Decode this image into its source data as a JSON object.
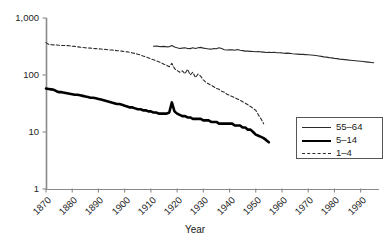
{
  "chart_data": {
    "type": "line",
    "title": "",
    "xlabel": "Year",
    "ylabel": "",
    "yscale": "log",
    "ylim": [
      1,
      1000
    ],
    "xlim": [
      1870,
      1997
    ],
    "grid": false,
    "legend_position": "bottom-right",
    "ytick_labels": [
      "1,000",
      "100",
      "10",
      "1"
    ],
    "ytick_values": [
      1000,
      100,
      10,
      1
    ],
    "xtick_labels": [
      "1870",
      "1880",
      "1890",
      "1900",
      "1910",
      "1920",
      "1930",
      "1940",
      "1950",
      "1960",
      "1970",
      "1980",
      "1990"
    ],
    "xtick_values": [
      1870,
      1880,
      1890,
      1900,
      1910,
      1920,
      1930,
      1940,
      1950,
      1960,
      1970,
      1980,
      1990
    ],
    "series": [
      {
        "name": "55–64",
        "style": "thin-solid",
        "color": "#2b2b2b",
        "x": [
          1911,
          1912,
          1913,
          1914,
          1915,
          1916,
          1917,
          1918,
          1919,
          1920,
          1921,
          1922,
          1923,
          1924,
          1925,
          1926,
          1927,
          1928,
          1929,
          1930,
          1931,
          1932,
          1933,
          1934,
          1935,
          1936,
          1937,
          1938,
          1939,
          1940,
          1941,
          1942,
          1943,
          1944,
          1945,
          1946,
          1947,
          1948,
          1949,
          1950,
          1951,
          1952,
          1953,
          1954,
          1955,
          1956,
          1957,
          1958,
          1959,
          1960,
          1961,
          1962,
          1963,
          1964,
          1965,
          1966,
          1967,
          1968,
          1969,
          1970,
          1971,
          1972,
          1973,
          1974,
          1975,
          1976,
          1977,
          1978,
          1979,
          1980,
          1981,
          1982,
          1983,
          1984,
          1985,
          1986,
          1987,
          1988,
          1989,
          1990,
          1991,
          1992,
          1993,
          1994,
          1995
        ],
        "y": [
          320,
          322,
          318,
          315,
          318,
          312,
          314,
          330,
          310,
          300,
          292,
          296,
          300,
          292,
          290,
          300,
          292,
          300,
          305,
          296,
          292,
          286,
          284,
          292,
          288,
          300,
          292,
          278,
          274,
          276,
          278,
          272,
          280,
          272,
          268,
          262,
          262,
          260,
          258,
          256,
          258,
          254,
          252,
          248,
          250,
          248,
          250,
          246,
          246,
          244,
          240,
          242,
          240,
          236,
          234,
          232,
          230,
          230,
          228,
          226,
          224,
          222,
          220,
          216,
          212,
          208,
          206,
          202,
          200,
          196,
          194,
          190,
          188,
          186,
          184,
          182,
          180,
          178,
          176,
          174,
          172,
          170,
          168,
          166,
          164
        ]
      },
      {
        "name": "5–14",
        "style": "thick-solid",
        "color": "#000000",
        "x": [
          1870,
          1871,
          1872,
          1873,
          1874,
          1875,
          1876,
          1877,
          1878,
          1879,
          1880,
          1881,
          1882,
          1883,
          1884,
          1885,
          1886,
          1887,
          1888,
          1889,
          1890,
          1891,
          1892,
          1893,
          1894,
          1895,
          1896,
          1897,
          1898,
          1899,
          1900,
          1901,
          1902,
          1903,
          1904,
          1905,
          1906,
          1907,
          1908,
          1909,
          1910,
          1911,
          1912,
          1913,
          1914,
          1915,
          1916,
          1917,
          1918,
          1919,
          1920,
          1921,
          1922,
          1923,
          1924,
          1925,
          1926,
          1927,
          1928,
          1929,
          1930,
          1931,
          1932,
          1933,
          1934,
          1935,
          1936,
          1937,
          1938,
          1939,
          1940,
          1941,
          1942,
          1943,
          1944,
          1945,
          1946,
          1947,
          1948,
          1949,
          1950,
          1951,
          1952,
          1953,
          1954,
          1955
        ],
        "y": [
          58,
          57,
          56,
          55,
          52,
          50,
          50,
          49,
          48,
          47,
          46,
          45,
          45,
          44,
          43,
          42,
          41,
          40,
          40,
          39,
          38,
          37,
          36,
          35,
          34,
          33,
          32,
          31,
          31,
          30,
          29,
          28,
          27,
          27,
          26,
          25,
          25,
          24,
          24,
          23,
          23,
          22,
          22,
          21,
          21,
          21,
          21,
          22,
          33,
          23,
          21,
          20,
          19,
          19,
          18,
          18,
          17,
          17,
          17,
          17,
          16,
          16,
          16,
          15,
          15,
          15,
          14,
          14,
          14,
          14,
          14,
          14,
          13,
          13,
          13,
          12,
          12,
          11,
          11,
          10,
          9,
          8.6,
          8.2,
          7.8,
          7.2,
          6.6
        ]
      },
      {
        "name": "1–4",
        "style": "dashed",
        "color": "#2b2b2b",
        "x": [
          1870,
          1871,
          1872,
          1873,
          1874,
          1875,
          1876,
          1877,
          1878,
          1879,
          1880,
          1881,
          1882,
          1883,
          1884,
          1885,
          1886,
          1887,
          1888,
          1889,
          1890,
          1891,
          1892,
          1893,
          1894,
          1895,
          1896,
          1897,
          1898,
          1899,
          1900,
          1901,
          1902,
          1903,
          1904,
          1905,
          1906,
          1907,
          1908,
          1909,
          1910,
          1911,
          1912,
          1913,
          1914,
          1915,
          1916,
          1917,
          1918,
          1919,
          1920,
          1921,
          1922,
          1923,
          1924,
          1925,
          1926,
          1927,
          1928,
          1929,
          1930,
          1931,
          1932,
          1933,
          1934,
          1935,
          1936,
          1937,
          1938,
          1939,
          1940,
          1941,
          1942,
          1943,
          1944,
          1945,
          1946,
          1947,
          1948,
          1949,
          1950,
          1951,
          1952,
          1953
        ],
        "y": [
          370,
          345,
          340,
          338,
          335,
          332,
          330,
          330,
          328,
          325,
          320,
          318,
          312,
          308,
          305,
          300,
          298,
          296,
          292,
          290,
          288,
          285,
          282,
          280,
          276,
          274,
          272,
          268,
          266,
          262,
          258,
          255,
          250,
          244,
          238,
          232,
          225,
          216,
          208,
          200,
          192,
          185,
          178,
          170,
          163,
          155,
          148,
          140,
          160,
          130,
          120,
          112,
          118,
          105,
          126,
          100,
          112,
          90,
          104,
          95,
          82,
          74,
          70,
          66,
          62,
          58,
          56,
          52,
          50,
          46,
          44,
          42,
          40,
          38,
          36,
          34,
          32,
          30,
          28,
          26,
          24,
          20,
          17,
          14
        ]
      }
    ]
  },
  "axes": {
    "x_title": "Year"
  },
  "legend": {
    "entries": [
      {
        "label": "55–64",
        "style": "thin-solid"
      },
      {
        "label": "5–14",
        "style": "thick-solid"
      },
      {
        "label": "1–4",
        "style": "dashed"
      }
    ]
  },
  "caption": ""
}
